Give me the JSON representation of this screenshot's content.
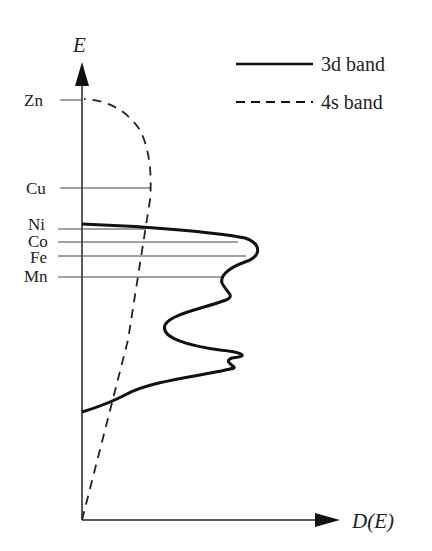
{
  "diagram": {
    "y_axis_label": "E",
    "x_axis_label": "D(E)",
    "legend": [
      {
        "label": "3d band",
        "style": "solid"
      },
      {
        "label": "4s band",
        "style": "dashed"
      }
    ],
    "levels": [
      {
        "label": "Zn",
        "y": 100
      },
      {
        "label": "Cu",
        "y": 188
      },
      {
        "label": "Ni",
        "y": 228
      },
      {
        "label": "Co",
        "y": 242
      },
      {
        "label": "Fe",
        "y": 256
      },
      {
        "label": "Mn",
        "y": 276
      }
    ],
    "colors": {
      "ink": "#222222",
      "background": "#ffffff"
    }
  }
}
